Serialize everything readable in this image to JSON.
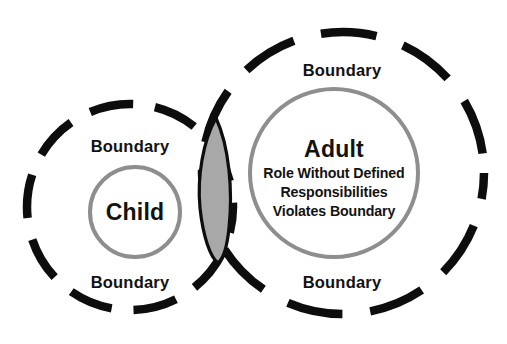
{
  "diagram": {
    "background_color": "#ffffff",
    "dashed_stroke_color": "#0d0d0d",
    "inner_circle_stroke_color": "#8e8e8e",
    "lens_fill_color": "#a8a8a8",
    "text_color": "#121212",
    "left_group": {
      "name": "child-group",
      "boundary_label_top": "Boundary",
      "boundary_label_bottom": "Boundary",
      "inner_label": "Child"
    },
    "right_group": {
      "name": "adult-group",
      "boundary_label_top": "Boundary",
      "boundary_label_bottom": "Boundary",
      "inner_title": "Adult",
      "inner_line_1": "Role Without Defined",
      "inner_line_2": "Responsibilities",
      "inner_line_3": "Violates Boundary"
    },
    "overlap": {
      "name": "boundary-overlap-lens",
      "fill": "#a8a8a8"
    }
  }
}
